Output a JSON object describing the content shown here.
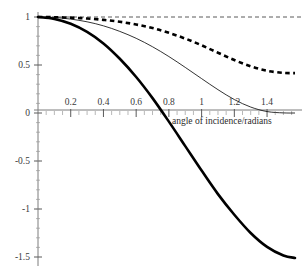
{
  "chart_data": {
    "type": "line",
    "title": "",
    "subtitle": "",
    "xlabel": "angle of incidence/radians",
    "ylabel": "",
    "xlim": [
      0,
      1.5708
    ],
    "ylim": [
      -1.5,
      1.0
    ],
    "grid": false,
    "legend": "none",
    "x_ticks": [
      0.2,
      0.4,
      0.6,
      0.8,
      1,
      1.2,
      1.4
    ],
    "x_tick_labels": [
      "0.2",
      "0.4",
      "0.6",
      "0.8",
      "1",
      "1.2",
      "1.4"
    ],
    "y_ticks": [
      1,
      0.5,
      0,
      -0.5,
      -1,
      -1.5
    ],
    "y_tick_labels": [
      "1",
      "0.5",
      "0",
      "-0.5",
      "-1",
      "-1.5"
    ],
    "annotations": [
      {
        "name": "reference-line",
        "type": "hline",
        "y": 1,
        "style": "dashed"
      }
    ],
    "series": [
      {
        "name": "thick-solid-curve",
        "style": "solid",
        "width": 2.6,
        "color": "#000000",
        "x": [
          0,
          0.1,
          0.2,
          0.3,
          0.4,
          0.5,
          0.6,
          0.7,
          0.8,
          0.9,
          1.0,
          1.1,
          1.2,
          1.3,
          1.4,
          1.5,
          1.5708
        ],
        "values": [
          1.0,
          0.98,
          0.93,
          0.845,
          0.725,
          0.565,
          0.375,
          0.155,
          -0.09,
          -0.345,
          -0.6,
          -0.845,
          -1.06,
          -1.25,
          -1.395,
          -1.485,
          -1.51
        ]
      },
      {
        "name": "thin-solid-curve",
        "style": "solid",
        "width": 0.8,
        "color": "#000000",
        "x": [
          0,
          0.1,
          0.2,
          0.3,
          0.4,
          0.5,
          0.6,
          0.7,
          0.8,
          0.9,
          1.0,
          1.1,
          1.2,
          1.3,
          1.4,
          1.5,
          1.5708
        ],
        "values": [
          1.0,
          0.995,
          0.978,
          0.95,
          0.908,
          0.85,
          0.778,
          0.69,
          0.588,
          0.475,
          0.358,
          0.243,
          0.14,
          0.062,
          0.015,
          0.001,
          0.0
        ]
      },
      {
        "name": "thick-dashed-curve",
        "style": "dashed",
        "width": 2.6,
        "color": "#000000",
        "x": [
          0,
          0.1,
          0.2,
          0.3,
          0.4,
          0.5,
          0.6,
          0.7,
          0.8,
          0.9,
          1.0,
          1.1,
          1.2,
          1.3,
          1.4,
          1.5,
          1.5708
        ],
        "values": [
          1.0,
          0.998,
          0.993,
          0.984,
          0.97,
          0.95,
          0.922,
          0.885,
          0.835,
          0.775,
          0.705,
          0.628,
          0.552,
          0.486,
          0.44,
          0.418,
          0.415
        ]
      }
    ]
  },
  "axes": {
    "x_axis_name": "x-axis",
    "y_axis_name": "y-axis"
  }
}
